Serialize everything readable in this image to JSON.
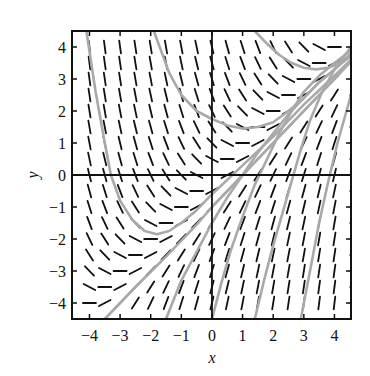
{
  "chart_data": {
    "type": "slope_field",
    "title": "",
    "xlabel": "x",
    "ylabel": "y",
    "xlim": [
      -4.57,
      4.54
    ],
    "ylim": [
      -4.5,
      4.5
    ],
    "xticks": [
      -4,
      -3,
      -2,
      -1,
      0,
      1,
      2,
      3,
      4
    ],
    "yticks": [
      -4,
      -3,
      -2,
      -1,
      0,
      1,
      2,
      3,
      4
    ],
    "xtick_labels": [
      "−4",
      "−3",
      "−2",
      "−1",
      "0",
      "1",
      "2",
      "3",
      "4"
    ],
    "ytick_labels": [
      "−4",
      "−3",
      "−2",
      "−1",
      "0",
      "1",
      "2",
      "3",
      "4"
    ],
    "grid": false,
    "axes_through_origin": true,
    "slope_field": {
      "equation": "dy/dx = x - y",
      "x_values": [
        -4,
        -3.5,
        -3,
        -2.5,
        -2,
        -1.5,
        -1,
        -0.5,
        0,
        0.5,
        1,
        1.5,
        2,
        2.5,
        3,
        3.5,
        4
      ],
      "y_values": [
        -4,
        -3.5,
        -3,
        -2.5,
        -2,
        -1.5,
        -1,
        -0.5,
        0,
        0.5,
        1,
        1.5,
        2,
        2.5,
        3,
        3.5,
        4
      ],
      "segment_color": "#111111"
    },
    "series": [
      {
        "name": "solution-curve-1",
        "color": "#a9a9a9",
        "points": [
          [
            -4.1,
            4.5
          ],
          [
            -3.8,
            2.6
          ],
          [
            -3.5,
            1.0
          ],
          [
            -3.3,
            0.0
          ],
          [
            -3.0,
            -0.8
          ],
          [
            -2.6,
            -1.4
          ],
          [
            -2.2,
            -1.75
          ],
          [
            -1.8,
            -1.85
          ],
          [
            -1.4,
            -1.75
          ],
          [
            -1.0,
            -1.5
          ],
          [
            -0.5,
            -1.1
          ],
          [
            0.0,
            -0.6
          ],
          [
            1.0,
            0.3
          ],
          [
            2.0,
            1.2
          ],
          [
            3.0,
            2.2
          ],
          [
            4.0,
            3.1
          ],
          [
            4.54,
            3.6
          ]
        ]
      },
      {
        "name": "solution-curve-2",
        "color": "#a9a9a9",
        "points": [
          [
            -1.9,
            4.5
          ],
          [
            -1.4,
            3.2
          ],
          [
            -1.0,
            2.5
          ],
          [
            -0.5,
            2.0
          ],
          [
            0.0,
            1.75
          ],
          [
            0.5,
            1.55
          ],
          [
            1.0,
            1.45
          ],
          [
            1.5,
            1.5
          ],
          [
            2.0,
            1.65
          ],
          [
            2.5,
            2.0
          ],
          [
            3.0,
            2.4
          ],
          [
            3.5,
            2.9
          ],
          [
            4.0,
            3.3
          ],
          [
            4.54,
            3.8
          ]
        ]
      },
      {
        "name": "solution-curve-3",
        "color": "#a9a9a9",
        "points": [
          [
            1.4,
            4.5
          ],
          [
            1.8,
            4.1
          ],
          [
            2.2,
            3.75
          ],
          [
            2.6,
            3.5
          ],
          [
            3.0,
            3.35
          ],
          [
            3.4,
            3.3
          ],
          [
            3.8,
            3.35
          ],
          [
            4.2,
            3.5
          ],
          [
            4.54,
            3.7
          ]
        ]
      },
      {
        "name": "solution-curve-asymptote",
        "color": "#a9a9a9",
        "points": [
          [
            -3.5,
            -4.5
          ],
          [
            -2.5,
            -3.5
          ],
          [
            -1.5,
            -2.55
          ],
          [
            -0.5,
            -1.55
          ],
          [
            0.0,
            -1.0
          ],
          [
            1.0,
            0.0
          ],
          [
            2.0,
            1.0
          ],
          [
            3.0,
            2.0
          ],
          [
            4.0,
            3.0
          ],
          [
            4.54,
            3.55
          ]
        ]
      },
      {
        "name": "solution-curve-4",
        "color": "#a9a9a9",
        "points": [
          [
            -1.5,
            -4.5
          ],
          [
            -1.0,
            -3.3
          ],
          [
            -0.5,
            -2.4
          ],
          [
            0.0,
            -1.5
          ],
          [
            0.5,
            -0.7
          ],
          [
            1.0,
            0.0
          ],
          [
            1.5,
            0.7
          ],
          [
            2.0,
            1.3
          ],
          [
            2.5,
            1.9
          ],
          [
            3.0,
            2.4
          ],
          [
            3.5,
            2.9
          ],
          [
            4.0,
            3.3
          ],
          [
            4.54,
            3.75
          ]
        ]
      },
      {
        "name": "solution-curve-5",
        "color": "#a9a9a9",
        "points": [
          [
            0.0,
            -4.5
          ],
          [
            0.3,
            -3.4
          ],
          [
            0.6,
            -2.4
          ],
          [
            1.0,
            -1.3
          ],
          [
            1.4,
            -0.3
          ],
          [
            1.8,
            0.5
          ],
          [
            2.2,
            1.3
          ],
          [
            2.6,
            2.0
          ],
          [
            3.0,
            2.6
          ],
          [
            3.5,
            3.1
          ],
          [
            4.0,
            3.5
          ],
          [
            4.54,
            3.9
          ]
        ]
      },
      {
        "name": "solution-curve-6",
        "color": "#a9a9a9",
        "points": [
          [
            1.4,
            -4.5
          ],
          [
            1.7,
            -3.3
          ],
          [
            2.0,
            -2.2
          ],
          [
            2.3,
            -1.2
          ],
          [
            2.6,
            -0.2
          ],
          [
            2.9,
            0.8
          ],
          [
            3.2,
            1.7
          ],
          [
            3.6,
            2.6
          ],
          [
            4.0,
            3.3
          ],
          [
            4.54,
            4.0
          ]
        ]
      },
      {
        "name": "solution-curve-7",
        "color": "#a9a9a9",
        "points": [
          [
            2.9,
            -4.5
          ],
          [
            3.2,
            -3.0
          ],
          [
            3.5,
            -1.5
          ],
          [
            3.8,
            -0.2
          ],
          [
            4.1,
            1.0
          ],
          [
            4.54,
            2.5
          ]
        ]
      }
    ]
  }
}
